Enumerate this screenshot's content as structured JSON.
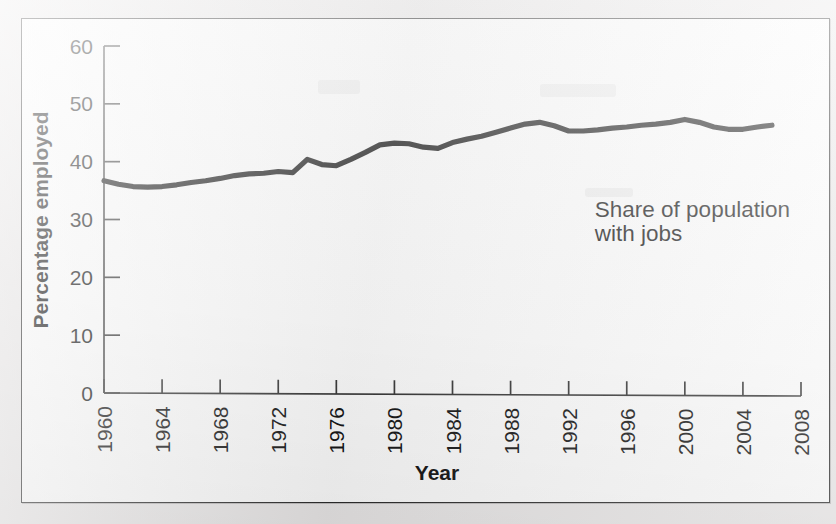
{
  "figure": {
    "background_color": "#eceaea",
    "panel_color": "#ffffff",
    "border_color": "#2b2b2b",
    "line_color": "#141414"
  },
  "chart_data": {
    "type": "line",
    "title": "",
    "subtitle": "",
    "xlabel": "Year",
    "ylabel": "Percentage employed",
    "xlim": [
      1960,
      2008
    ],
    "ylim": [
      0,
      60
    ],
    "grid": false,
    "legend_position": "none",
    "x_tick_labels": [
      "1960",
      "1964",
      "1968",
      "1972",
      "1976",
      "1980",
      "1984",
      "1988",
      "1992",
      "1996",
      "2000",
      "2004",
      "2008"
    ],
    "x_ticks": [
      1960,
      1964,
      1968,
      1972,
      1976,
      1980,
      1984,
      1988,
      1992,
      1996,
      2000,
      2004,
      2008
    ],
    "y_tick_labels": [
      "0",
      "10",
      "20",
      "30",
      "40",
      "50",
      "60"
    ],
    "y_ticks": [
      0,
      10,
      20,
      30,
      40,
      50,
      60
    ],
    "x_tick_label_rotation": -90,
    "annotations": [
      {
        "name": "series-annotation",
        "lines": [
          "Share of population",
          "with jobs"
        ],
        "x": 1993.8,
        "y": 30.5
      }
    ],
    "series": [
      {
        "name": "Share of population with jobs",
        "x": [
          1960,
          1961,
          1962,
          1963,
          1964,
          1965,
          1966,
          1967,
          1968,
          1969,
          1970,
          1971,
          1972,
          1973,
          1974,
          1975,
          1976,
          1977,
          1978,
          1979,
          1980,
          1981,
          1982,
          1983,
          1984,
          1985,
          1986,
          1987,
          1988,
          1989,
          1990,
          1991,
          1992,
          1993,
          1994,
          1995,
          1996,
          1997,
          1998,
          1999,
          2000,
          2001,
          2002,
          2003,
          2004,
          2005,
          2006
        ],
        "values": [
          36.7,
          36.1,
          35.7,
          35.6,
          35.7,
          36.0,
          36.4,
          36.7,
          37.1,
          37.6,
          37.9,
          38.0,
          38.3,
          38.1,
          40.4,
          39.5,
          39.3,
          40.4,
          41.6,
          42.9,
          43.2,
          43.1,
          42.5,
          42.3,
          43.3,
          43.9,
          44.4,
          45.1,
          45.8,
          46.5,
          46.8,
          46.2,
          45.3,
          45.3,
          45.5,
          45.8,
          46.0,
          46.3,
          46.5,
          46.8,
          47.3,
          46.8,
          46.0,
          45.6,
          45.6,
          46.0,
          46.3
        ]
      }
    ]
  },
  "caption": {
    "cut_off_text": ""
  }
}
